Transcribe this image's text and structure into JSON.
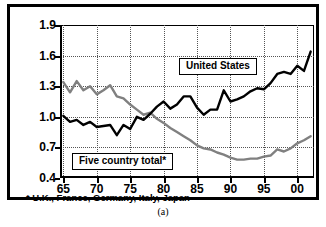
{
  "caption": "(a)",
  "footnote": "* U.K., France, Germany, Italy, Japan",
  "labels": {
    "united_states": "United States",
    "five_country": "Five country total*"
  },
  "colors": {
    "united_states_line": "#000000",
    "five_country_line": "#808080",
    "grid": "#555555",
    "axis": "#000000",
    "background": "#ffffff"
  },
  "chart_data": {
    "type": "line",
    "title": "",
    "subtitle": "",
    "xlabel": "",
    "ylabel": "",
    "xlim": [
      1964.5,
      2002.5
    ],
    "ylim": [
      0.4,
      1.9
    ],
    "grid": true,
    "legend_position": "inline-callout-boxes",
    "y_ticks": [
      "0.4",
      "0.7",
      "1.0",
      "1.3",
      "1.6",
      "1.9"
    ],
    "y_tick_values": [
      0.4,
      0.7,
      1.0,
      1.3,
      1.6,
      1.9
    ],
    "x_ticks": [
      "65",
      "70",
      "75",
      "80",
      "85",
      "90",
      "95",
      "00"
    ],
    "x_tick_values": [
      1965,
      1970,
      1975,
      1980,
      1985,
      1990,
      1995,
      2000
    ],
    "annotations": [
      {
        "text": "United States",
        "x": 1988,
        "y": 1.47
      },
      {
        "text": "Five country total*",
        "x": 1973,
        "y": 0.62
      }
    ],
    "x": [
      1965,
      1966,
      1967,
      1968,
      1969,
      1970,
      1971,
      1972,
      1973,
      1974,
      1975,
      1976,
      1977,
      1978,
      1979,
      1980,
      1981,
      1982,
      1983,
      1984,
      1985,
      1986,
      1987,
      1988,
      1989,
      1990,
      1991,
      1992,
      1993,
      1994,
      1995,
      1996,
      1997,
      1998,
      1999,
      2000,
      2001,
      2002
    ],
    "series": [
      {
        "name": "United States",
        "color": "#000000",
        "values": [
          1.01,
          0.95,
          0.97,
          0.92,
          0.95,
          0.9,
          0.91,
          0.92,
          0.82,
          0.92,
          0.88,
          1.0,
          0.97,
          1.03,
          1.1,
          1.15,
          1.08,
          1.12,
          1.2,
          1.2,
          1.09,
          1.02,
          1.07,
          1.07,
          1.26,
          1.15,
          1.17,
          1.2,
          1.25,
          1.28,
          1.27,
          1.33,
          1.42,
          1.44,
          1.42,
          1.5,
          1.45,
          1.64
        ]
      },
      {
        "name": "Five country total*",
        "color": "#808080",
        "values": [
          1.34,
          1.24,
          1.35,
          1.26,
          1.3,
          1.22,
          1.26,
          1.31,
          1.2,
          1.18,
          1.12,
          1.07,
          1.02,
          1.04,
          0.98,
          0.94,
          0.89,
          0.85,
          0.81,
          0.77,
          0.72,
          0.69,
          0.68,
          0.65,
          0.63,
          0.6,
          0.58,
          0.58,
          0.59,
          0.59,
          0.61,
          0.62,
          0.68,
          0.66,
          0.69,
          0.74,
          0.77,
          0.81
        ]
      }
    ]
  }
}
